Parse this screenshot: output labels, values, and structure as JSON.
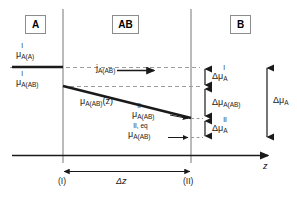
{
  "figure": {
    "type": "schematic-diagram"
  },
  "regions": [
    {
      "id": "A",
      "label": "A",
      "x": 31,
      "y": 16
    },
    {
      "id": "AB",
      "label": "AB",
      "x": 118,
      "y": 16
    },
    {
      "id": "B",
      "label": "B",
      "x": 236,
      "y": 16
    }
  ],
  "curve_labels": {
    "mu_I_A_A": {
      "base": "μ",
      "sub": "A(A)",
      "sup": "I"
    },
    "mu_I_A_AB": {
      "base": "μ",
      "sub": "A(AB)",
      "sup": "I"
    },
    "mu_A_AB_of_z": {
      "base": "μ",
      "sub": "A(AB)",
      "suffix": "(z)"
    },
    "mu_II_A_AB": {
      "base": "μ",
      "sub": "A(AB)",
      "sup": "II"
    },
    "mu_II_eq_A_AB": {
      "base": "μ",
      "sub": "A(AB)",
      "sup": "II, eq"
    },
    "flux_j_A_AB": {
      "base": "j",
      "sub": "A(AB)"
    }
  },
  "delta_labels": {
    "delta_mu_I_A": {
      "base": "Δμ",
      "sub": "A",
      "sup": "I"
    },
    "delta_mu_A_AB": {
      "base": "Δμ",
      "sub": "A(AB)"
    },
    "delta_mu_II_A": {
      "base": "Δμ",
      "sub": "A",
      "sup": "II"
    },
    "delta_mu_A": {
      "base": "Δμ",
      "sub": "A"
    }
  },
  "axis": {
    "z_label": "z",
    "boundary_left": "(I)",
    "boundary_right": "(II)",
    "delta_z": "Δz"
  },
  "colors": {
    "line": "#1a1a1a",
    "dashed": "#9b9b9b",
    "box_border": "#8c8c8c",
    "background": "#ffffff"
  },
  "geometry": {
    "x_left_boundary": 63,
    "x_right_boundary": 191,
    "y_level_I_A": 67,
    "y_level_I_AB": 86,
    "y_level_II_AB": 118,
    "y_level_II_eq": 137,
    "y_axis": 155
  }
}
